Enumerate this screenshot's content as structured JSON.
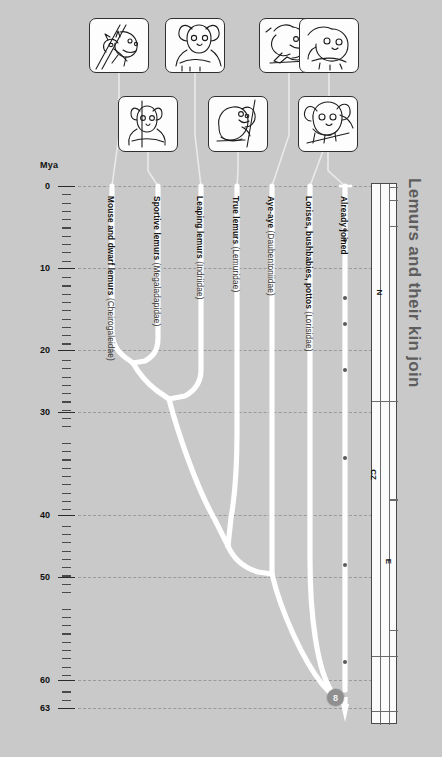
{
  "title": "Lemurs and their kin join",
  "axis": {
    "unit_label": "Mya",
    "ticks": [
      {
        "value": "0",
        "y": 186
      },
      {
        "value": "10",
        "y": 268
      },
      {
        "value": "20",
        "y": 350
      },
      {
        "value": "30",
        "y": 412
      },
      {
        "value": "40",
        "y": 515
      },
      {
        "value": "50",
        "y": 577
      },
      {
        "value": "60",
        "y": 680
      },
      {
        "value": "63",
        "y": 708
      }
    ],
    "gridlines": [
      186,
      268,
      350,
      412,
      515,
      577,
      680,
      708
    ]
  },
  "taxa": [
    {
      "name_bold": "Mouse and dwarf lemurs",
      "family": "(Cheirogaleidae)",
      "tip_x": 112,
      "label_y": 196
    },
    {
      "name_bold": "Sportive lemurs",
      "family": "(Megaladapidae)",
      "tip_x": 158,
      "label_y": 196
    },
    {
      "name_bold": "Leaping lemurs",
      "family": "(Indriidae)",
      "tip_x": 201,
      "label_y": 196
    },
    {
      "name_bold": "True lemurs",
      "family": "(Lemuridae)",
      "tip_x": 237,
      "label_y": 196
    },
    {
      "name_bold": "Aye-aye",
      "family": "(Daubentoniidae)",
      "tip_x": 272,
      "label_y": 196
    },
    {
      "name_bold": "Lorises, bushbabies, pottos",
      "family": "(Lorisidae)",
      "tip_x": 310,
      "label_y": 196
    },
    {
      "name_bold": "Already joined",
      "family": "",
      "tip_x": 345,
      "label_y": 196
    }
  ],
  "root_badge": {
    "number": "8"
  },
  "geologic_column": [
    {
      "label": "N",
      "top": 186,
      "height": 214
    },
    {
      "label": "CZ",
      "top": 400,
      "height": 150
    },
    {
      "label": "E",
      "top": 498,
      "height": 128
    }
  ],
  "event_dots_y": [
    228,
    238,
    296,
    322,
    368,
    456,
    563,
    660
  ],
  "illustrations": {
    "row_top": [
      {
        "name": "lemur-on-branch",
        "x": 89,
        "y": 18,
        "w": 60,
        "h": 55,
        "connector_x": 112
      },
      {
        "name": "sportive-lemur",
        "x": 165,
        "y": 18,
        "w": 60,
        "h": 55,
        "connector_x": 201
      },
      {
        "name": "aye-aye-hand",
        "x": 259,
        "y": 18,
        "w": 60,
        "h": 55,
        "connector_x": 272
      },
      {
        "name": "loris-face",
        "x": 299,
        "y": 18,
        "w": 60,
        "h": 55,
        "connector_x": 310
      }
    ],
    "row_bottom": [
      {
        "name": "dwarf-lemur",
        "x": 118,
        "y": 96,
        "w": 60,
        "h": 56,
        "connector_x": 158
      },
      {
        "name": "indri-climb",
        "x": 208,
        "y": 96,
        "w": 60,
        "h": 56,
        "connector_x": 237
      },
      {
        "name": "ring-tail-lemur",
        "x": 298,
        "y": 96,
        "w": 60,
        "h": 56,
        "connector_x": 345
      }
    ]
  },
  "colors": {
    "background": "#c9c9c9",
    "branch": "#ffffff",
    "grid": "#9a9a9a",
    "axis_text": "#111111",
    "title": "#5d5d5d",
    "badge": "#8f8f8f"
  }
}
